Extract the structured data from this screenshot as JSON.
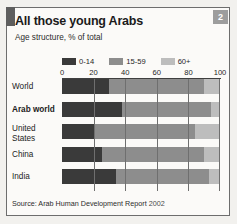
{
  "figure": {
    "badge_number": "2",
    "title": "All those young Arabs",
    "subtitle": "Age structure, % of total",
    "source_prefix": "Source: Arab Human Development Report",
    "source_year": "2002"
  },
  "colors": {
    "age_0_14": "#3a3a3a",
    "age_15_59": "#8d8d8d",
    "age_60_plus": "#bdbdbd",
    "frame": "#6d6d6d",
    "badge": "#9d9d9d",
    "axis": "#3f3f3f",
    "background": "#fbfaf8"
  },
  "chart_data": {
    "type": "bar",
    "orientation": "horizontal",
    "stacked": true,
    "title": "All those young Arabs",
    "subtitle": "Age structure, % of total",
    "xlabel": "",
    "ylabel": "",
    "xlim": [
      0,
      100
    ],
    "xticks": [
      0,
      20,
      40,
      60,
      80,
      100
    ],
    "xtick_labels": [
      "0",
      "20",
      "40",
      "60",
      "80",
      "100"
    ],
    "grid": true,
    "legend_position": "top",
    "categories": [
      "World",
      "Arab world",
      "United States",
      "China",
      "India"
    ],
    "category_emphasis": [
      false,
      true,
      false,
      false,
      false
    ],
    "series": [
      {
        "name": "0-14",
        "color": "#3a3a3a",
        "values": [
          30,
          38,
          21,
          25,
          34
        ]
      },
      {
        "name": "15-59",
        "color": "#8d8d8d",
        "values": [
          60,
          56,
          63,
          65,
          59
        ]
      },
      {
        "name": "60+",
        "color": "#bdbdbd",
        "values": [
          10,
          6,
          16,
          10,
          7
        ]
      }
    ],
    "source": "Source: Arab Human Development Report 2002"
  }
}
